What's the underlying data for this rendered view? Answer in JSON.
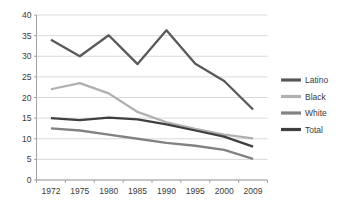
{
  "chart_data": {
    "type": "line",
    "title": "",
    "xlabel": "",
    "ylabel": "",
    "categories": [
      "1972",
      "1975",
      "1980",
      "1985",
      "1990",
      "1995",
      "2000",
      "2009"
    ],
    "ylim": [
      0,
      40
    ],
    "ytick_step": 5,
    "yticks": [
      "0",
      "5",
      "10",
      "15",
      "20",
      "25",
      "30",
      "35",
      "40"
    ],
    "grid": "horizontal",
    "legend_position": "right",
    "series": [
      {
        "name": "Latino",
        "color": "#595959",
        "values": [
          34.0,
          30.0,
          35.1,
          28.1,
          36.3,
          28.2,
          24.0,
          17.1
        ]
      },
      {
        "name": "Black",
        "color": "#b0b0b0",
        "values": [
          22.0,
          23.5,
          21.0,
          16.5,
          14.0,
          12.4,
          11.0,
          10.1
        ]
      },
      {
        "name": "White",
        "color": "#828282",
        "values": [
          12.5,
          12.0,
          11.0,
          10.0,
          9.0,
          8.3,
          7.3,
          5.1
        ]
      },
      {
        "name": "Total",
        "color": "#3f3f3f",
        "values": [
          15.0,
          14.5,
          15.1,
          14.7,
          13.5,
          12.0,
          10.5,
          8.1
        ]
      }
    ]
  },
  "legend": {
    "items": [
      {
        "label": "Latino"
      },
      {
        "label": "Black"
      },
      {
        "label": "White"
      },
      {
        "label": "Total"
      }
    ]
  },
  "axis": {
    "y_labels": [
      "40",
      "35",
      "30",
      "25",
      "20",
      "15",
      "10",
      "5",
      "0"
    ],
    "x_labels": [
      "1972",
      "1975",
      "1980",
      "1985",
      "1990",
      "1995",
      "2000",
      "2009"
    ]
  }
}
